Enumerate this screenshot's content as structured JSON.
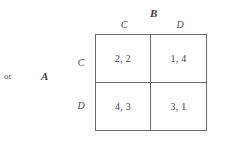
{
  "figure": {
    "kind": "payoff-matrix",
    "prefix_text": "or",
    "row_player": "A",
    "column_player": "B",
    "column_headers": [
      "C",
      "D"
    ],
    "row_headers": [
      "C",
      "D"
    ],
    "cells": [
      {
        "row": "C",
        "col": "C",
        "payoff": "2, 2"
      },
      {
        "row": "C",
        "col": "D",
        "payoff": "1, 4"
      },
      {
        "row": "D",
        "col": "C",
        "payoff": "4, 3"
      },
      {
        "row": "D",
        "col": "D",
        "payoff": "3, 1"
      }
    ],
    "colors": {
      "background": "#ffffff",
      "rule": "#6b6b6b",
      "text": "#3f3f3f"
    }
  }
}
